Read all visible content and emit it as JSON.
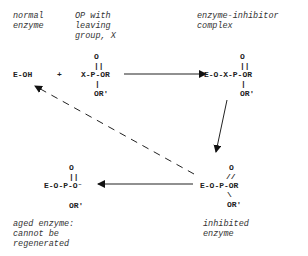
{
  "labels": {
    "normal_enzyme": "normal\nenzyme",
    "op_leaving": "OP with\nleaving\ngroup, X",
    "complex": "enzyme-inhibitor\ncomplex",
    "aged": "aged enzyme:\ncannot be\nregenerated",
    "inhibited": "inhibited\nenzyme"
  },
  "species": {
    "eoh": "E-OH",
    "plus": "+",
    "op": {
      "top": "O",
      "bond": "||",
      "main": "X-P-OR",
      "down": "|",
      "bottom": "OR'"
    },
    "complex": {
      "top": "O",
      "bond": "||",
      "main": "E-O-X-P-OR",
      "down": "|",
      "bottom": "OR'"
    },
    "inhibited": {
      "top": "O",
      "bond": "//",
      "main": "E-O-P-OR",
      "down": "\\",
      "bottom": "OR'"
    },
    "aged": {
      "top": "O",
      "bond": "||",
      "main": "E-O-P-O⁻",
      "bottom": "OR'"
    }
  },
  "arrows": [
    {
      "from": "op",
      "to": "complex",
      "style": "solid"
    },
    {
      "from": "complex",
      "to": "inhibited",
      "style": "solid"
    },
    {
      "from": "inhibited",
      "to": "aged",
      "style": "solid"
    },
    {
      "from": "inhibited",
      "to": "normal_enzyme",
      "style": "dashed"
    }
  ],
  "colors": {
    "ink": "#222222",
    "label": "#333333"
  }
}
